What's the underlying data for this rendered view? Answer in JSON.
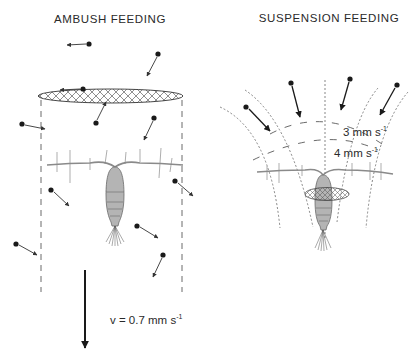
{
  "panels": {
    "ambush": {
      "title": "AMBUSH FEEDING",
      "sinking_velocity_label": "v = 0.7 mm s",
      "sinking_velocity_exponent": "-1",
      "particles": [
        {
          "dot": [
            89,
            44
          ],
          "tip": [
            67,
            45
          ]
        },
        {
          "dot": [
            158,
            54
          ],
          "tip": [
            147,
            76
          ]
        },
        {
          "dot": [
            83,
            89
          ],
          "tip": [
            60,
            90
          ]
        },
        {
          "dot": [
            96,
            123
          ],
          "tip": [
            106,
            102
          ]
        },
        {
          "dot": [
            22,
            124
          ],
          "tip": [
            45,
            129
          ]
        },
        {
          "dot": [
            154,
            118
          ],
          "tip": [
            144,
            140
          ]
        },
        {
          "dot": [
            51,
            190
          ],
          "tip": [
            69,
            206
          ]
        },
        {
          "dot": [
            175,
            181
          ],
          "tip": [
            193,
            196
          ]
        },
        {
          "dot": [
            137,
            226
          ],
          "tip": [
            158,
            238
          ]
        },
        {
          "dot": [
            16,
            244
          ],
          "tip": [
            37,
            255
          ]
        },
        {
          "dot": [
            163,
            255
          ],
          "tip": [
            153,
            277
          ]
        }
      ]
    },
    "suspension": {
      "title": "SUSPENSION FEEDING",
      "flow_label_outer": "3 mm s",
      "flow_label_outer_exponent": "-1",
      "flow_label_inner": "4 mm s",
      "flow_label_inner_exponent": "-1",
      "particles": [
        {
          "dot": [
            291,
            83
          ],
          "tip": [
            300,
            117
          ]
        },
        {
          "dot": [
            350,
            79
          ],
          "tip": [
            341,
            110
          ]
        },
        {
          "dot": [
            397,
            85
          ],
          "tip": [
            380,
            115
          ]
        },
        {
          "dot": [
            246,
            107
          ],
          "tip": [
            270,
            131
          ]
        }
      ]
    }
  },
  "colors": {
    "ink": "#1a1a1a",
    "body_fill": "#b4b4b4",
    "body_stroke": "#6a6a6a",
    "flow_line": "#555555",
    "particle_arrow": "#333333",
    "antenna": "#8a8a8a"
  }
}
